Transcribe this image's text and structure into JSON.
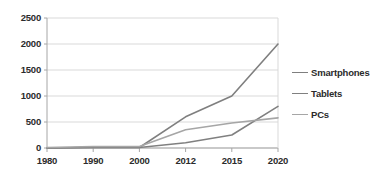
{
  "chart_data": {
    "type": "line",
    "title": "",
    "xlabel": "",
    "ylabel": "",
    "categories": [
      "1980",
      "1990",
      "2000",
      "2012",
      "2015",
      "2020"
    ],
    "ylim": [
      0,
      2500
    ],
    "yticks": [
      0,
      500,
      1000,
      1500,
      2000,
      2500
    ],
    "ytick_labels": [
      "0",
      "500",
      "1000",
      "1500",
      "2000",
      "2500"
    ],
    "grid": true,
    "legend_position": "right",
    "series": [
      {
        "name": "Smartphones",
        "color": "#7f7f7f",
        "values": [
          0,
          10,
          10,
          600,
          1000,
          2000
        ]
      },
      {
        "name": "Tablets",
        "color": "#808080",
        "values": [
          0,
          10,
          10,
          100,
          250,
          800
        ]
      },
      {
        "name": "PCs",
        "color": "#a6a6a6",
        "values": [
          10,
          30,
          30,
          350,
          480,
          580
        ]
      }
    ]
  },
  "style": {
    "plot_background": "#ffffff",
    "grid_color": "#d9d9d9",
    "axis_color": "#a6a6a6",
    "text_color": "#2b2b2b"
  },
  "geometry": {
    "plot_left": 47,
    "plot_right": 278,
    "plot_top": 18,
    "plot_bottom": 148
  }
}
